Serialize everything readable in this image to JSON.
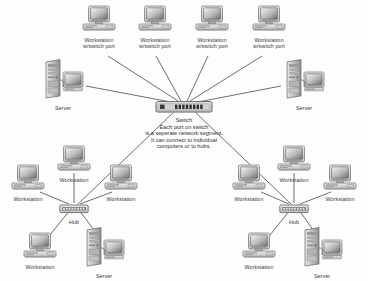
{
  "diagram": {
    "background_color": "#fdfdfd",
    "line_color": "#444444",
    "text_color": "#3a3a3a",
    "center_note": {
      "lines": [
        "Switch",
        "Each port on switch",
        "is a seperate network segment.",
        "It can connect to individual",
        "computers or to hubs."
      ],
      "line1": "Switch",
      "line2": "Each port on switch",
      "line3": "is a seperate network segment.",
      "line4": "It can connect to individual",
      "line5": "computers or to hubs."
    },
    "nodes": [
      {
        "id": "ws_top_1",
        "icon": "workstation-icon",
        "label_line1": "Workstation",
        "label_line2": "w/switch port",
        "x": 99,
        "y": 5
      },
      {
        "id": "ws_top_2",
        "icon": "workstation-icon",
        "label_line1": "Workstation",
        "label_line2": "w/switch port",
        "x": 155,
        "y": 5
      },
      {
        "id": "ws_top_3",
        "icon": "workstation-icon",
        "label_line1": "Workstation",
        "label_line2": "w/switch port",
        "x": 212,
        "y": 5
      },
      {
        "id": "ws_top_4",
        "icon": "workstation-icon",
        "label_line1": "Workstation",
        "label_line2": "w/switch port",
        "x": 269,
        "y": 5
      },
      {
        "id": "server_left_top",
        "icon": "server-icon",
        "label_line1": "Server",
        "label_line2": "",
        "x": 63,
        "y": 58
      },
      {
        "id": "server_right_top",
        "icon": "server-icon",
        "label_line1": "Server",
        "label_line2": "",
        "x": 304,
        "y": 58
      },
      {
        "id": "switch_center",
        "icon": "switch-icon",
        "label_line1": "",
        "label_line2": "",
        "x": 184,
        "y": 103
      },
      {
        "id": "ws_left_upper",
        "icon": "workstation-icon",
        "label_line1": "Workstation",
        "label_line2": "",
        "x": 74,
        "y": 148
      },
      {
        "id": "ws_left_west",
        "icon": "workstation-icon",
        "label_line1": "Workstation",
        "label_line2": "",
        "x": 28,
        "y": 167
      },
      {
        "id": "ws_left_east",
        "icon": "workstation-icon",
        "label_line1": "Workstation",
        "label_line2": "",
        "x": 121,
        "y": 167
      },
      {
        "id": "hub_left",
        "icon": "hub-icon",
        "label_line1": "Hub",
        "label_line2": "",
        "x": 74,
        "y": 204
      },
      {
        "id": "ws_left_lower",
        "icon": "workstation-icon",
        "label_line1": "Workstation",
        "label_line2": "",
        "x": 40,
        "y": 232
      },
      {
        "id": "server_left_bottom",
        "icon": "server-icon",
        "label_line1": "Server",
        "label_line2": "",
        "x": 104,
        "y": 228
      },
      {
        "id": "ws_right_upper",
        "icon": "workstation-icon",
        "label_line1": "Workstation",
        "label_line2": "",
        "x": 223,
        "y": 148
      },
      {
        "id": "ws_right_west",
        "icon": "workstation-icon",
        "label_line1": "Workstation",
        "label_line2": "",
        "x": 249,
        "y": 167
      },
      {
        "id": "ws_right_east",
        "icon": "workstation-icon",
        "label_line1": "Workstation",
        "label_line2": "",
        "x": 340,
        "y": 167
      },
      {
        "id": "hub_right",
        "icon": "hub-icon",
        "label_line1": "Hub",
        "label_line2": "",
        "x": 294,
        "y": 204
      },
      {
        "id": "ws_right_lower",
        "icon": "workstation-icon",
        "label_line1": "Workstation",
        "label_line2": "",
        "x": 259,
        "y": 232
      },
      {
        "id": "server_right_bottom",
        "icon": "server-icon",
        "label_line1": "Server",
        "label_line2": "",
        "x": 322,
        "y": 228
      }
    ],
    "labels": {
      "workstation": "Workstation",
      "workstation_switch_port_line2": "w/switch port",
      "server": "Server",
      "hub": "Hub",
      "switch": "Switch"
    }
  }
}
